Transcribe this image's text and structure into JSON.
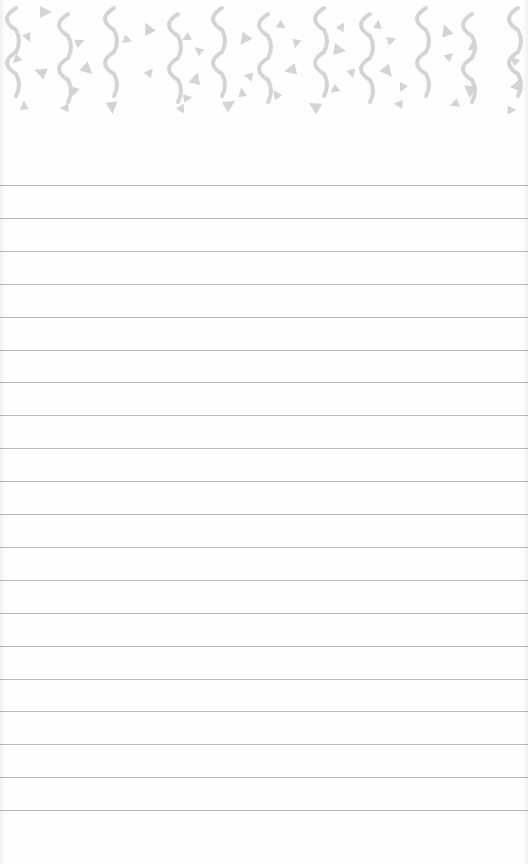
{
  "page": {
    "type": "lined-notepad",
    "background_color": "#fefefe",
    "rule_color": "#b9b9b9",
    "rule_count": 20,
    "first_rule_y": 185,
    "rule_spacing": 32.9
  },
  "header": {
    "pattern": "confetti-squiggles-and-triangles",
    "pattern_color": "#d4d4d4",
    "squiggle_x": [
      10,
      62,
      108,
      172,
      216,
      262,
      318,
      364,
      420,
      466,
      512
    ],
    "triangles": [
      [
        46,
        12
      ],
      [
        28,
        38
      ],
      [
        16,
        60
      ],
      [
        40,
        72
      ],
      [
        24,
        105
      ],
      [
        80,
        42
      ],
      [
        88,
        70
      ],
      [
        74,
        92
      ],
      [
        64,
        108
      ],
      [
        148,
        28
      ],
      [
        150,
        72
      ],
      [
        128,
        40
      ],
      [
        112,
        108
      ],
      [
        186,
        38
      ],
      [
        198,
        50
      ],
      [
        196,
        78
      ],
      [
        188,
        98
      ],
      [
        182,
        110
      ],
      [
        244,
        40
      ],
      [
        248,
        76
      ],
      [
        242,
        92
      ],
      [
        230,
        104
      ],
      [
        282,
        26
      ],
      [
        296,
        44
      ],
      [
        290,
        70
      ],
      [
        276,
        94
      ],
      [
        342,
        26
      ],
      [
        340,
        50
      ],
      [
        352,
        74
      ],
      [
        334,
        90
      ],
      [
        314,
        106
      ],
      [
        378,
        24
      ],
      [
        392,
        40
      ],
      [
        388,
        72
      ],
      [
        402,
        88
      ],
      [
        398,
        104
      ],
      [
        446,
        30
      ],
      [
        450,
        56
      ],
      [
        474,
        48
      ],
      [
        470,
        92
      ],
      [
        454,
        104
      ],
      [
        514,
        60
      ],
      [
        518,
        84
      ],
      [
        512,
        110
      ]
    ]
  }
}
